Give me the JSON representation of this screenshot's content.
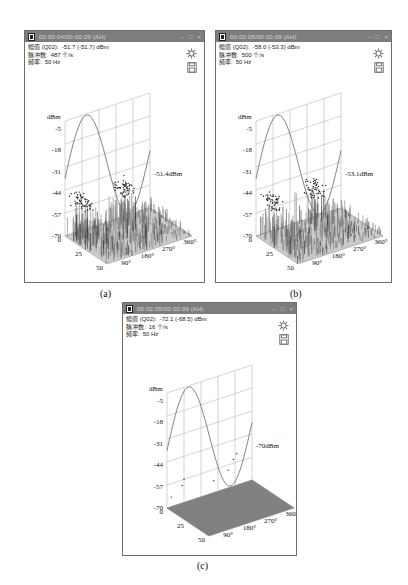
{
  "panels": [
    {
      "id": "a",
      "caption": "(a)",
      "window": {
        "title": "00:00:04/00:00:09 (AH)",
        "minimize": "–",
        "maximize": "□",
        "close": "×"
      },
      "info": {
        "amplitude_label": "幅值 (Q02):",
        "amplitude_value": "-51.7 (-51.7) dBm",
        "pulse_label": "脉冲数:",
        "pulse_value": "487 个/s",
        "freq_label": "频率:",
        "freq_value": "50 Hz"
      },
      "icons": [
        "gear-icon",
        "save-icon"
      ],
      "marker_label": "-51.4dBm"
    },
    {
      "id": "b",
      "caption": "(b)",
      "window": {
        "title": "00:00:05/00:00:09 (AH)",
        "minimize": "–",
        "maximize": "□",
        "close": "×"
      },
      "info": {
        "amplitude_label": "幅值 (Q02):",
        "amplitude_value": "-58.0 (-53.3) dBm",
        "pulse_label": "脉冲数:",
        "pulse_value": "500 个/s",
        "freq_label": "频率:",
        "freq_value": "50 Hz"
      },
      "icons": [
        "gear-icon",
        "save-icon"
      ],
      "marker_label": "-53.1dBm"
    },
    {
      "id": "c",
      "caption": "(c)",
      "window": {
        "title": "00:02:05/00:00:09 (AH)",
        "minimize": "–",
        "maximize": "□",
        "close": "×"
      },
      "info": {
        "amplitude_label": "幅值 (Q02):",
        "amplitude_value": "-72.1 (-68.5) dBm",
        "pulse_label": "脉冲数:",
        "pulse_value": "16 个/s",
        "freq_label": "频率:",
        "freq_value": "50 Hz"
      },
      "icons": [
        "gear-icon",
        "save-icon"
      ],
      "marker_label": "-70dBm"
    }
  ],
  "chart_data": [
    {
      "panel": "a",
      "type": "scatter",
      "title": "PRPD 3D",
      "ylabel": "dBm",
      "y_ticks": [
        "-5",
        "-18",
        "-31",
        "-44",
        "-57",
        "-70"
      ],
      "ylim": [
        -70,
        -5
      ],
      "depth_ticks": [
        "0",
        "25",
        "50"
      ],
      "x_ticks": [
        "90°",
        "180°",
        "270°",
        "360°"
      ],
      "xlim": [
        0,
        360
      ],
      "reference": "sine",
      "annotation": "-51.4dBm",
      "peak_level_dbm": -51.4
    },
    {
      "panel": "b",
      "type": "scatter",
      "title": "PRPD 3D",
      "ylabel": "dBm",
      "y_ticks": [
        "-5",
        "-18",
        "-31",
        "-44",
        "-57",
        "-70"
      ],
      "ylim": [
        -70,
        -5
      ],
      "depth_ticks": [
        "0",
        "25",
        "50"
      ],
      "x_ticks": [
        "90°",
        "180°",
        "270°",
        "360°"
      ],
      "xlim": [
        0,
        360
      ],
      "reference": "sine",
      "annotation": "-53.1dBm",
      "peak_level_dbm": -53.1
    },
    {
      "panel": "c",
      "type": "scatter",
      "title": "PRPD 3D",
      "ylabel": "dBm",
      "y_ticks": [
        "-5",
        "-18",
        "-31",
        "-44",
        "-57",
        "-70"
      ],
      "ylim": [
        -70,
        -5
      ],
      "depth_ticks": [
        "0",
        "25",
        "50"
      ],
      "x_ticks": [
        "90°",
        "180°",
        "270°",
        "360°"
      ],
      "xlim": [
        0,
        360
      ],
      "reference": "sine",
      "annotation": "-70dBm",
      "peak_level_dbm": -70
    }
  ]
}
